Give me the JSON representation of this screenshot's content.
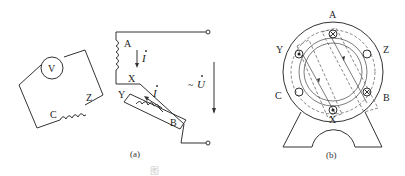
{
  "figure": {
    "panel_a": {
      "caption": "(a)",
      "voltmeter_label": "V",
      "coil_labels": {
        "A": "A",
        "X": "X",
        "Y": "Y",
        "B": "B",
        "C": "C",
        "Z": "Z"
      },
      "current_label": "I",
      "voltage_label": "U",
      "ac_symbol": "~"
    },
    "panel_b": {
      "caption": "(b)",
      "terminal_labels": {
        "A": "A",
        "Y": "Y",
        "Z": "Z",
        "C": "C",
        "B": "B",
        "X": "X"
      }
    },
    "bottom_caption_fragment": "图"
  }
}
